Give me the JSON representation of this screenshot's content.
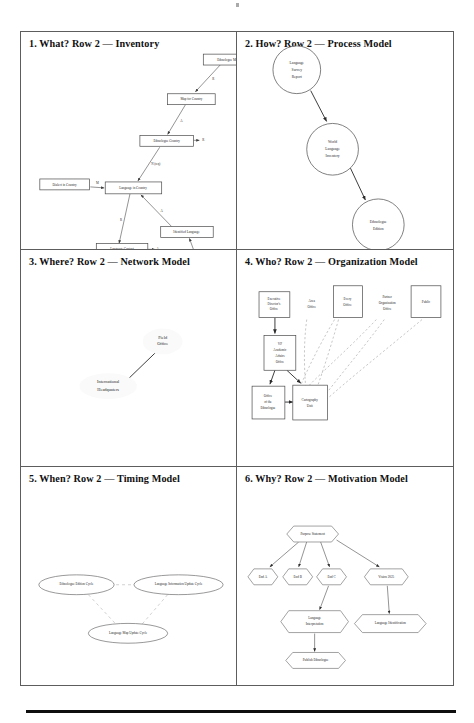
{
  "document": {
    "type": "scanned-page",
    "footer_rule": true
  },
  "panels": [
    {
      "id": "what",
      "title": "1. What?  Row 2 — Inventory",
      "model_kind": "Inventory",
      "shape_style": "rectangle",
      "nodes": [
        {
          "name": "ethnologue-map",
          "label": "Ethnologue Map",
          "x": 184,
          "y": 22,
          "w": 50,
          "h": 11
        },
        {
          "name": "map-for-country",
          "label": "Map for Country",
          "x": 148,
          "y": 62,
          "w": 48,
          "h": 11
        },
        {
          "name": "ethnologue-country",
          "label": "Ethnologue Country",
          "x": 120,
          "y": 105,
          "w": 54,
          "h": 11
        },
        {
          "name": "dialect-in-country",
          "label": "Dialect in Country",
          "x": 19,
          "y": 148,
          "w": 50,
          "h": 11
        },
        {
          "name": "language-in-country",
          "label": "Language in Country",
          "x": 85,
          "y": 152,
          "w": 57,
          "h": 11
        },
        {
          "name": "language-contact",
          "label": "Language Contact",
          "x": 76,
          "y": 215,
          "w": 52,
          "h": 11
        },
        {
          "name": "identified-language",
          "label": "Identified Language",
          "x": 141,
          "y": 196,
          "w": 53,
          "h": 11
        },
        {
          "name": "linguistic-subgroup",
          "label": "Linguistic Subgroup",
          "x": 167,
          "y": 249,
          "w": 53,
          "h": 11
        }
      ],
      "edges": [
        {
          "from": "ethnologue-map",
          "to": "map-for-country",
          "label": "R"
        },
        {
          "from": "map-for-country",
          "to": "ethnologue-country",
          "label": "A"
        },
        {
          "from": "ethnologue-country",
          "to": "language-in-country",
          "label": "N (req)"
        },
        {
          "from": "dialect-in-country",
          "to": "language-in-country",
          "label": "M"
        },
        {
          "from": "language-in-country",
          "to": "language-contact",
          "label": "R"
        },
        {
          "from": "identified-language",
          "to": "language-in-country",
          "label": "A"
        },
        {
          "from": "linguistic-subgroup",
          "to": "identified-language",
          "label": "A"
        },
        {
          "from": "language-contact",
          "to": "language-contact",
          "label": "A"
        },
        {
          "from": "ethnologue-country",
          "to": "ethnologue-country",
          "label": "R"
        },
        {
          "from": "linguistic-subgroup",
          "to": "linguistic-subgroup",
          "label": "S"
        }
      ]
    },
    {
      "id": "how",
      "title": "2. How?  Row 2 — Process Model",
      "model_kind": "Process Model",
      "shape_style": "circle",
      "nodes": [
        {
          "name": "language-survey-report",
          "label": "Language Survey Report",
          "cx": 60,
          "cy": 38,
          "r": 24
        },
        {
          "name": "world-language-inventory",
          "label": "World Language Inventory",
          "cx": 96,
          "cy": 118,
          "r": 26
        },
        {
          "name": "ethnologue-edition",
          "label": "Ethnologue Edition",
          "cx": 142,
          "cy": 194,
          "r": 26
        },
        {
          "name": "language-map-inventory",
          "label": "Language Map Inventory",
          "cx": 157,
          "cy": 268,
          "r": 25
        }
      ],
      "edges": [
        {
          "from": "language-survey-report",
          "to": "world-language-inventory"
        },
        {
          "from": "world-language-inventory",
          "to": "ethnologue-edition"
        },
        {
          "from": "language-map-inventory",
          "to": "ethnologue-edition"
        }
      ]
    },
    {
      "id": "where",
      "title": "3. Where?  Row 2 — Network Model",
      "model_kind": "Network Model",
      "shape_style": "blob",
      "nodes": [
        {
          "name": "field-office",
          "label": "Field Office",
          "cx": 143,
          "cy": 92,
          "rx": 20,
          "ry": 13
        },
        {
          "name": "international-headquaters",
          "label": "International Headquaters",
          "cx": 88,
          "cy": 137,
          "rx": 29,
          "ry": 13
        }
      ],
      "edges": [
        {
          "from": "international-headquaters",
          "to": "field-office"
        }
      ]
    },
    {
      "id": "who",
      "title": "4. Who?  Row 2 — Organization Model",
      "model_kind": "Organization Model",
      "shape_style": "rectangle",
      "nodes": [
        {
          "name": "executive-directors-office",
          "label": "Executive Director's Office",
          "x": 22,
          "y": 42,
          "w": 31,
          "h": 26,
          "bordered": true
        },
        {
          "name": "area-office",
          "label": "Area Office",
          "x": 62,
          "y": 42,
          "w": 27,
          "h": 26,
          "bordered": false
        },
        {
          "name": "every-office",
          "label": "Every Office",
          "x": 97,
          "y": 36,
          "w": 29,
          "h": 32,
          "bordered": true
        },
        {
          "name": "partner-organization-office",
          "label": "Partner Organization Office",
          "x": 133,
          "y": 40,
          "w": 36,
          "h": 28,
          "bordered": false
        },
        {
          "name": "public",
          "label": "Public",
          "x": 175,
          "y": 36,
          "w": 30,
          "h": 32,
          "bordered": true
        },
        {
          "name": "vp-academic-affairs-office",
          "label": "VP Academic Affairs Office",
          "x": 27,
          "y": 86,
          "w": 32,
          "h": 35,
          "bordered": true
        },
        {
          "name": "office-of-the-ethnologue",
          "label": "Office of the Ethnologue",
          "x": 15,
          "y": 137,
          "w": 33,
          "h": 33,
          "bordered": true
        },
        {
          "name": "cartography-unit",
          "label": "Cartography Unit",
          "x": 56,
          "y": 136,
          "w": 35,
          "h": 35,
          "bordered": true
        }
      ],
      "edges": [
        {
          "from": "executive-directors-office",
          "to": "vp-academic-affairs-office",
          "style": "solid"
        },
        {
          "from": "vp-academic-affairs-office",
          "to": "office-of-the-ethnologue",
          "style": "solid"
        },
        {
          "from": "vp-academic-affairs-office",
          "to": "cartography-unit",
          "style": "solid"
        },
        {
          "from": "office-of-the-ethnologue",
          "to": "cartography-unit",
          "style": "solid"
        },
        {
          "from": "area-office",
          "to": "cartography-unit",
          "style": "dashed"
        },
        {
          "from": "every-office",
          "to": "cartography-unit",
          "style": "dashed"
        },
        {
          "from": "partner-organization-office",
          "to": "cartography-unit",
          "style": "dashed"
        },
        {
          "from": "public",
          "to": "cartography-unit",
          "style": "dashed"
        },
        {
          "from": "every-office",
          "to": "office-of-the-ethnologue",
          "style": "dashed"
        },
        {
          "from": "partner-organization-office",
          "to": "office-of-the-ethnologue",
          "style": "dashed"
        }
      ]
    },
    {
      "id": "when",
      "title": "5. When?  Row 2 — Timing Model",
      "model_kind": "Timing Model",
      "shape_style": "ellipse",
      "nodes": [
        {
          "name": "ethnologue-edition-cycle",
          "label": "Ethnologue Edition Cycle",
          "cx": 56,
          "cy": 118,
          "rx": 38,
          "ry": 10
        },
        {
          "name": "language-information-update-cycle",
          "label": "Language Information Update Cycle",
          "cx": 159,
          "cy": 118,
          "rx": 45,
          "ry": 10
        },
        {
          "name": "language-map-update-cycle",
          "label": "Language Map Update Cycle",
          "cx": 108,
          "cy": 167,
          "rx": 40,
          "ry": 10
        }
      ],
      "edges": [
        {
          "from": "ethnologue-edition-cycle",
          "to": "language-information-update-cycle"
        },
        {
          "from": "ethnologue-edition-cycle",
          "to": "language-map-update-cycle"
        },
        {
          "from": "language-information-update-cycle",
          "to": "language-map-update-cycle"
        }
      ]
    },
    {
      "id": "why",
      "title": "6. Why?  Row 2 — Motivation Model",
      "model_kind": "Motivation Model",
      "shape_style": "hexagon",
      "nodes": [
        {
          "name": "purpose-statement",
          "label": "Purpose Statement",
          "cx": 76,
          "cy": 67,
          "rx": 30,
          "ry": 8
        },
        {
          "name": "end-a",
          "label": "End A",
          "cx": 26,
          "cy": 110,
          "rx": 15,
          "ry": 8
        },
        {
          "name": "end-b",
          "label": "End B",
          "cx": 61,
          "cy": 110,
          "rx": 15,
          "ry": 8
        },
        {
          "name": "end-c",
          "label": "End C",
          "cx": 95,
          "cy": 110,
          "rx": 15,
          "ry": 8
        },
        {
          "name": "vision-2025",
          "label": "Vision 2025",
          "cx": 150,
          "cy": 110,
          "rx": 22,
          "ry": 8
        },
        {
          "name": "language-interpretation",
          "label": "Language Interpretation",
          "cx": 78,
          "cy": 155,
          "rx": 34,
          "ry": 11
        },
        {
          "name": "language-identification",
          "label": "Language Identification",
          "cx": 154,
          "cy": 157,
          "rx": 36,
          "ry": 9
        },
        {
          "name": "publish-ethnologue",
          "label": "Publish Ethnologue",
          "cx": 79,
          "cy": 194,
          "rx": 30,
          "ry": 8
        }
      ],
      "edges": [
        {
          "from": "purpose-statement",
          "to": "end-a"
        },
        {
          "from": "purpose-statement",
          "to": "end-b"
        },
        {
          "from": "purpose-statement",
          "to": "end-c"
        },
        {
          "from": "purpose-statement",
          "to": "vision-2025"
        },
        {
          "from": "end-c",
          "to": "language-interpretation"
        },
        {
          "from": "vision-2025",
          "to": "language-identification"
        },
        {
          "from": "language-interpretation",
          "to": "publish-ethnologue"
        }
      ]
    }
  ]
}
